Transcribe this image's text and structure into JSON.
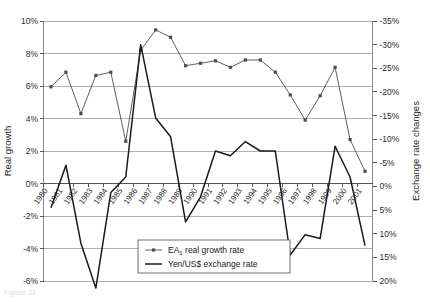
{
  "figure": {
    "caption": "Figure 11"
  },
  "chart_data": {
    "type": "line",
    "title": "",
    "xlabel": "",
    "ylabel": "Real growth",
    "y2label": "Exchange rate changes",
    "grid": true,
    "legend_position": "bottom-center",
    "categories": [
      "1980",
      "1981",
      "1982",
      "1983",
      "1984",
      "1985",
      "1986",
      "1987",
      "1988",
      "1989",
      "1990",
      "1991",
      "1992",
      "1993",
      "1994",
      "1995",
      "1996",
      "1997",
      "1998",
      "1999",
      "2000",
      "2001"
    ],
    "ylim": [
      -6,
      10
    ],
    "yticks": [
      "-6%",
      "-4%",
      "-2%",
      "0%",
      "2%",
      "4%",
      "6%",
      "8%",
      "10%"
    ],
    "ytick_values": [
      -6,
      -4,
      -2,
      0,
      2,
      4,
      6,
      8,
      10
    ],
    "y2lim": [
      -35,
      20
    ],
    "y2_inverted": true,
    "y2ticks": [
      "-35%",
      "-30%",
      "-25%",
      "-20%",
      "-15%",
      "-10%",
      "-5%",
      "0%",
      "5%",
      "10%",
      "15%",
      "20%"
    ],
    "y2tick_values": [
      -35,
      -30,
      -25,
      -20,
      -15,
      -10,
      -5,
      0,
      5,
      10,
      15,
      20
    ],
    "series": [
      {
        "name": "EA1 real growth rate",
        "legend_label": "EA",
        "legend_sub": "1",
        "legend_rest": " real growth rate",
        "axis": "left",
        "marker": "square",
        "color": "#4d4d4d",
        "values": [
          5.95,
          6.85,
          4.3,
          6.65,
          6.85,
          2.6,
          8.2,
          9.45,
          9.0,
          7.25,
          7.4,
          7.55,
          7.15,
          7.6,
          7.6,
          6.85,
          5.45,
          3.9,
          5.4,
          7.15,
          2.7,
          0.75
        ]
      },
      {
        "name": "Yen/US$ exchange rate",
        "legend_label": "Yen/US$ exchange rate",
        "axis": "right",
        "marker": "none",
        "color": "#1a1a1a",
        "values": [
          4.5,
          -4.5,
          12.0,
          21.5,
          1.3,
          -2.0,
          -30.0,
          -14.5,
          -10.5,
          7.5,
          2.2,
          -7.5,
          -6.5,
          -9.5,
          -7.5,
          -7.5,
          14.5,
          10.2,
          11.0,
          -8.5,
          -2.0,
          12.5
        ]
      }
    ]
  },
  "legend": {
    "items": [
      {
        "label": "EA",
        "sub": "1",
        "rest": " real growth rate",
        "marker": "line-with-square"
      },
      {
        "label": "Yen/US$ exchange rate",
        "sub": "",
        "rest": "",
        "marker": "line"
      }
    ]
  }
}
